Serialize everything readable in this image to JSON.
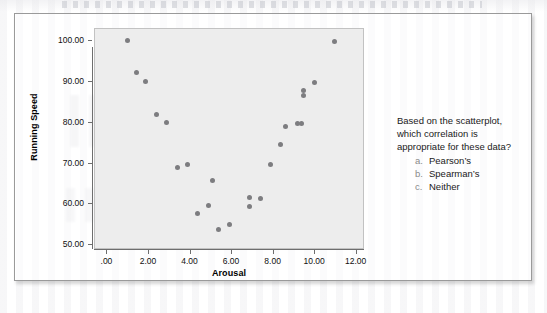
{
  "figure": {
    "type": "scatterplot-question-figure"
  },
  "chart_data": {
    "type": "scatter",
    "title": "",
    "xlabel": "Arousal",
    "ylabel": "Running Speed",
    "xlim": [
      -0.6,
      12.4
    ],
    "ylim": [
      48.8,
      103.0
    ],
    "xticks": [
      0,
      2,
      4,
      6,
      8,
      10,
      12
    ],
    "xtick_labels": [
      ".00",
      "2.00",
      "4.00",
      "6.00",
      "8.00",
      "10.00",
      "12.00"
    ],
    "yticks": [
      50,
      60,
      70,
      80,
      90,
      100
    ],
    "ytick_labels": [
      "50.00",
      "60.00",
      "70.00",
      "80.00",
      "90.00",
      "100.00"
    ],
    "grid": false,
    "legend": "none",
    "marker_color": "#7d7d80",
    "plot_background": "#ededed",
    "points": [
      {
        "x": 1.0,
        "y": 100.0
      },
      {
        "x": 1.45,
        "y": 92.0
      },
      {
        "x": 1.9,
        "y": 90.0
      },
      {
        "x": 2.4,
        "y": 81.8
      },
      {
        "x": 2.9,
        "y": 79.8
      },
      {
        "x": 3.4,
        "y": 68.7
      },
      {
        "x": 3.9,
        "y": 69.6
      },
      {
        "x": 4.4,
        "y": 57.6
      },
      {
        "x": 4.9,
        "y": 59.5
      },
      {
        "x": 5.1,
        "y": 65.6
      },
      {
        "x": 5.4,
        "y": 53.6
      },
      {
        "x": 5.9,
        "y": 54.7
      },
      {
        "x": 6.9,
        "y": 61.4
      },
      {
        "x": 6.9,
        "y": 59.3
      },
      {
        "x": 7.4,
        "y": 61.3
      },
      {
        "x": 7.9,
        "y": 69.5
      },
      {
        "x": 8.4,
        "y": 74.5
      },
      {
        "x": 8.6,
        "y": 78.9
      },
      {
        "x": 9.2,
        "y": 79.7
      },
      {
        "x": 9.4,
        "y": 79.7
      },
      {
        "x": 9.5,
        "y": 87.6
      },
      {
        "x": 9.5,
        "y": 86.5
      },
      {
        "x": 10.0,
        "y": 89.7
      },
      {
        "x": 11.0,
        "y": 99.7
      }
    ]
  },
  "question": {
    "line1": "Based on the scatterplot,",
    "line2": "which correlation is",
    "line3": "appropriate for these data?",
    "choices": [
      {
        "letter": "a.",
        "text": "Pearson’s"
      },
      {
        "letter": "b.",
        "text": "Spearman’s"
      },
      {
        "letter": "c.",
        "text": "Neither"
      }
    ]
  }
}
